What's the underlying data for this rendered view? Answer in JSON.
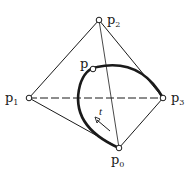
{
  "diagram": {
    "type": "bezier-control-tetrahedron",
    "points": {
      "p0": {
        "label": "p",
        "subscript": "0",
        "x": 119,
        "y": 148
      },
      "p1": {
        "label": "p",
        "subscript": "1",
        "x": 29,
        "y": 98
      },
      "p2": {
        "label": "p",
        "subscript": "2",
        "x": 99,
        "y": 20
      },
      "p3": {
        "label": "p",
        "subscript": "3",
        "x": 163,
        "y": 98
      },
      "p": {
        "label": "p",
        "subscript": "",
        "x": 93,
        "y": 69
      }
    },
    "parameter_label": "t",
    "colors": {
      "line": "#1a1a1a",
      "background": "#ffffff"
    }
  }
}
